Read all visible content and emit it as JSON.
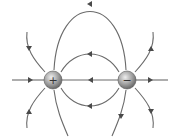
{
  "diagram": {
    "charges": [
      {
        "id": "positive",
        "sign": "+",
        "cx": 53,
        "cy": 80,
        "r": 9
      },
      {
        "id": "negative",
        "sign": "−",
        "cx": 127,
        "cy": 80,
        "r": 9
      }
    ],
    "colors": {
      "line": "#6a6a6a",
      "arrow": "#4a4a4a",
      "sphere_light": "#e8e8e8",
      "sphere_dark": "#6e6e6e"
    }
  }
}
